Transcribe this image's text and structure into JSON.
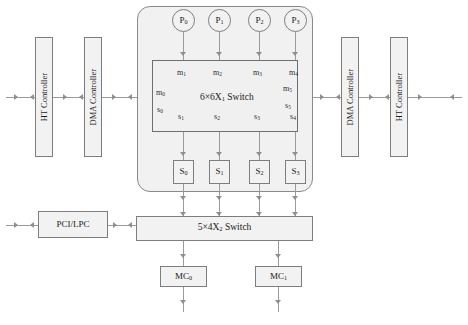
{
  "diagram": {
    "colors": {
      "box_fill": "#f2f2f2",
      "box_border": "#7d7d7d",
      "cluster_fill": "#f1f1f1",
      "line": "#9a9a9a",
      "background": "#ffffff"
    }
  },
  "cores": [
    {
      "label": "P",
      "index": "0"
    },
    {
      "label": "P",
      "index": "1"
    },
    {
      "label": "P",
      "index": "2"
    },
    {
      "label": "P",
      "index": "3"
    }
  ],
  "crossbar_primary": {
    "label": "6×6X",
    "index": "1",
    "suffix": " Switch",
    "ports_master_top": [
      {
        "label": "m",
        "index": "1"
      },
      {
        "label": "m",
        "index": "2"
      },
      {
        "label": "m",
        "index": "3"
      },
      {
        "label": "m",
        "index": "4"
      }
    ],
    "ports_slave_bottom": [
      {
        "label": "s",
        "index": "1"
      },
      {
        "label": "s",
        "index": "2"
      },
      {
        "label": "s",
        "index": "3"
      },
      {
        "label": "s",
        "index": "4"
      }
    ],
    "port_left_master": {
      "label": "m",
      "index": "0"
    },
    "port_left_slave": {
      "label": "s",
      "index": "0"
    },
    "port_right_master": {
      "label": "m",
      "index": "5"
    },
    "port_right_slave": {
      "label": "s",
      "index": "5"
    }
  },
  "slaves": [
    {
      "label": "S",
      "index": "0"
    },
    {
      "label": "S",
      "index": "1"
    },
    {
      "label": "S",
      "index": "2"
    },
    {
      "label": "S",
      "index": "3"
    }
  ],
  "crossbar_secondary": {
    "label": "5×4X",
    "index": "2",
    "suffix": " Switch"
  },
  "memory_controllers": [
    {
      "label": "MC",
      "index": "0"
    },
    {
      "label": "MC",
      "index": "1"
    }
  ],
  "io_left": {
    "ht_controller": "HT Controller",
    "dma_controller": "DMA Controller"
  },
  "io_right": {
    "dma_controller": "DMA Controller",
    "ht_controller": "HT Controller"
  },
  "peripheral_bus": {
    "label": "PCI/LPC"
  }
}
